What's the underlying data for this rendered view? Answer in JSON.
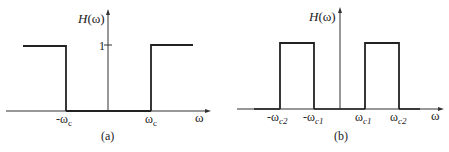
{
  "panel_a": {
    "caption": "(a)",
    "y_axis_label_fn": "H",
    "y_axis_label_arg": "(ω)",
    "x_axis_label": "ω",
    "level_label": "1",
    "tick_neg": "-ω",
    "tick_neg_sub": "c",
    "tick_pos": "ω",
    "tick_pos_sub": "c",
    "description": "Ideal high-pass filter: H(ω)=1 for |ω|>ωc, 0 otherwise"
  },
  "panel_b": {
    "caption": "(b)",
    "y_axis_label_fn": "H",
    "y_axis_label_arg": "(ω)",
    "x_axis_label": "ω",
    "ticks": [
      {
        "main": "-ω",
        "sub": "c2"
      },
      {
        "main": "-ω",
        "sub": "c1"
      },
      {
        "main": "ω",
        "sub": "c1"
      },
      {
        "main": "ω",
        "sub": "c2"
      }
    ],
    "description": "Ideal band-pass filter: H(ω)=1 for ωc1<|ω|<ωc2, 0 otherwise"
  },
  "colors": {
    "line": "#222222",
    "axis": "#333333",
    "background": "#ffffff"
  }
}
